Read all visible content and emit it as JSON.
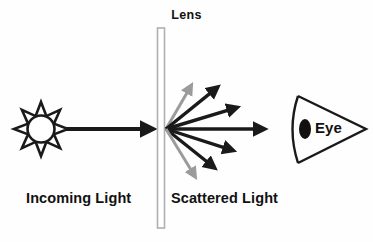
{
  "background_color": "#fefefe",
  "labels": {
    "lens": "Lens",
    "incoming_light": "Incoming Light",
    "scattered_light": "Scattered Light",
    "eye": "Eye"
  },
  "colors": {
    "stroke_dark": "#1a1a1a",
    "stroke_gray": "#9b9b9b",
    "lens_outline": "#b0b0b0",
    "lens_fill": "#ffffff",
    "text": "#111111",
    "pupil": "#111111"
  },
  "elements": {
    "sun": {
      "name": "sun-icon",
      "center_x": 41,
      "center_y": 129,
      "outer_radius": 27,
      "inner_radius": 14,
      "points": 8,
      "fill": "#ffffff",
      "stroke": "#1a1a1a"
    },
    "lens": {
      "name": "lens-bar",
      "x": 157,
      "y": 28,
      "width": 7,
      "height": 200
    },
    "eye": {
      "name": "eye-icon",
      "apex_x": 366,
      "apex_y": 129,
      "back_x": 298,
      "top_y": 96,
      "bottom_y": 163,
      "pupil_cx": 305,
      "pupil_cy": 129,
      "pupil_rx": 6,
      "pupil_ry": 10
    },
    "incoming_arrow": {
      "name": "incoming-light-arrow",
      "x1": 65,
      "y1": 129,
      "x2": 155,
      "y2": 129,
      "color": "#1a1a1a",
      "width": 4
    },
    "scatter_origin": {
      "x": 166,
      "y": 129
    }
  },
  "chart_data": {
    "type": "diagram",
    "scatter_rays": [
      {
        "id": "ray-up-far",
        "angle_deg": 52,
        "tip_x": 195,
        "tip_y": 79,
        "color": "#9b9b9b",
        "width": 3.0
      },
      {
        "id": "ray-up-mid",
        "angle_deg": 38,
        "tip_x": 224,
        "tip_y": 82,
        "color": "#1a1a1a",
        "width": 3.4
      },
      {
        "id": "ray-up-near",
        "angle_deg": 18,
        "tip_x": 245,
        "tip_y": 105,
        "color": "#1a1a1a",
        "width": 3.4
      },
      {
        "id": "ray-center",
        "angle_deg": 0,
        "tip_x": 273,
        "tip_y": 129,
        "color": "#1a1a1a",
        "width": 3.6
      },
      {
        "id": "ray-down-near",
        "angle_deg": -18,
        "tip_x": 241,
        "tip_y": 153,
        "color": "#1a1a1a",
        "width": 3.4
      },
      {
        "id": "ray-down-mid",
        "angle_deg": -38,
        "tip_x": 221,
        "tip_y": 173,
        "color": "#1a1a1a",
        "width": 3.4
      },
      {
        "id": "ray-down-far",
        "angle_deg": -52,
        "tip_x": 199,
        "tip_y": 183,
        "color": "#9b9b9b",
        "width": 3.0
      }
    ],
    "annotations": [
      "Lens",
      "Incoming Light",
      "Scattered Light",
      "Eye"
    ]
  }
}
